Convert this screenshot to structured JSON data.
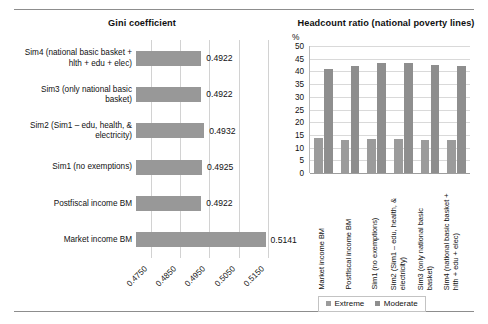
{
  "figure": {
    "background": "#ffffff",
    "rule_color": "#8d8d8d"
  },
  "charts": [
    {
      "id": "gini",
      "title": "Gini coefficient"
    },
    {
      "id": "headcount",
      "title": "Headcount ratio (national poverty lines)",
      "unit": "%"
    }
  ],
  "legend": {
    "items": [
      {
        "label": "Extreme",
        "color": "#9b9b9b"
      },
      {
        "label": "Moderate",
        "color": "#8e8e8e"
      }
    ]
  },
  "chart_data": [
    {
      "type": "bar",
      "orientation": "horizontal",
      "title": "Gini coefficient",
      "xlabel": "",
      "ylabel": "",
      "xlim": [
        0.47,
        0.519
      ],
      "grid": true,
      "xticks": [
        "0.4750",
        "0.4850",
        "0.4950",
        "0.5050",
        "0.5150"
      ],
      "xtick_values": [
        0.475,
        0.485,
        0.495,
        0.505,
        0.515
      ],
      "bar_color": "#989898",
      "categories": [
        "Market income BM",
        "Postfiscal income BM",
        "Sim1 (no exemptions)",
        "Sim2 (Sim1 – edu, health, & electricity)",
        "Sim3 (only national basic basket)",
        "Sim4 (national basic basket + hlth + edu + elec)"
      ],
      "category_lines": [
        [
          "Market income BM"
        ],
        [
          "Postfiscal income BM"
        ],
        [
          "Sim1 (no exemptions)"
        ],
        [
          "Sim2 (Sim1 – edu, health, &",
          "electricity)"
        ],
        [
          "Sim3 (only national basic",
          "basket)"
        ],
        [
          "Sim4 (national basic basket +",
          "hlth + edu + elec)"
        ]
      ],
      "values": [
        0.5141,
        0.4922,
        0.4925,
        0.4932,
        0.4922,
        0.4922
      ],
      "data_labels": [
        "0.5141",
        "0.4922",
        "0.4925",
        "0.4932",
        "0.4922",
        "0.4922"
      ]
    },
    {
      "type": "bar",
      "orientation": "vertical",
      "grouped": true,
      "title": "Headcount ratio (national poverty lines)",
      "xlabel": "",
      "ylabel": "%",
      "ylim": [
        0,
        50
      ],
      "grid": true,
      "yticks": [
        "0",
        "5",
        "10",
        "15",
        "20",
        "25",
        "30",
        "35",
        "40",
        "45",
        "50"
      ],
      "ytick_values": [
        0,
        5,
        10,
        15,
        20,
        25,
        30,
        35,
        40,
        45,
        50
      ],
      "legend_position": "bottom",
      "categories": [
        "Market income BM",
        "Postfiscal income BM",
        "Sim1 (no exemptions)",
        "Sim2 (Sim1 – edu, health, & electricity)",
        "Sim3 (only national basic basket)",
        "Sim4 (national basic basket + hlth + edu + elec)"
      ],
      "category_lines": [
        [
          "Market income BM"
        ],
        [
          "Postfiscal income BM"
        ],
        [
          "Sim1 (no exemptions)"
        ],
        [
          "Sim2 (Sim1 – edu, health, &",
          "electricity)"
        ],
        [
          "Sim3 (only national basic",
          "basket)"
        ],
        [
          "Sim4 (national basic basket +",
          "hlth + edu + elec)"
        ]
      ],
      "series": [
        {
          "name": "Extreme",
          "color": "#9b9b9b",
          "values": [
            13.6,
            13.0,
            13.5,
            13.5,
            13.0,
            13.0
          ]
        },
        {
          "name": "Moderate",
          "color": "#8e8e8e",
          "values": [
            41.0,
            42.2,
            43.5,
            43.3,
            42.4,
            42.3
          ]
        }
      ]
    }
  ]
}
